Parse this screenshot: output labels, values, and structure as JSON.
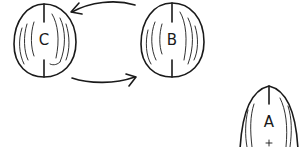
{
  "diagram": {
    "style": "hand-drawn sketch",
    "colors": {
      "ink": "#1a1a1a",
      "background": "#ffffff"
    },
    "nodes": [
      {
        "id": "C",
        "label": "C",
        "shape": "walnut",
        "cx": 44,
        "cy": 40
      },
      {
        "id": "B",
        "label": "B",
        "shape": "walnut",
        "cx": 172,
        "cy": 40
      },
      {
        "id": "A",
        "label": "A",
        "shape": "walnut",
        "cx": 269,
        "cy": 122
      }
    ],
    "edges": [
      {
        "from": "B",
        "to": "C",
        "style": "curved-arrow",
        "position": "top"
      },
      {
        "from": "C",
        "to": "B",
        "style": "curved-arrow",
        "position": "bottom"
      }
    ]
  }
}
